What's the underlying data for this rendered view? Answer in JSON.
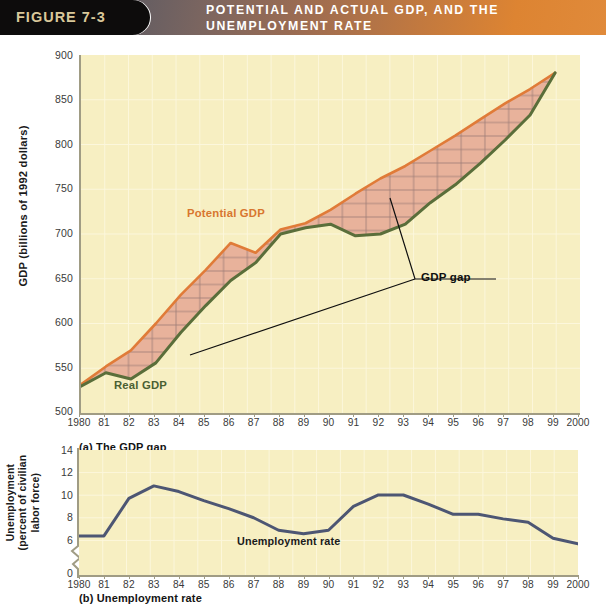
{
  "header": {
    "figure_number": "FIGURE 7-3",
    "title_line1": "POTENTIAL AND ACTUAL GDP, AND THE",
    "title_line2": "UNEMPLOYMENT RATE",
    "pill_color": "#0d0c0c",
    "figure_number_color": "#d9c89a",
    "gradient_start": "#4b5264",
    "gradient_end": "#e08a3a"
  },
  "panel_a": {
    "caption": "(a) The GDP gap",
    "ylabel": "GDP (billions of 1992 dollars)",
    "series_label_potential": "Potential GDP",
    "series_label_real": "Real GDP",
    "annotation_gap": "GDP gap"
  },
  "panel_b": {
    "caption": "(b) Unemployment rate",
    "ylabel_line1": "Unemployment",
    "ylabel_line2": "(percent of civilian",
    "ylabel_line3": "labor force)",
    "series_label": "Unemployment rate"
  },
  "footnote": "",
  "chart_data": [
    {
      "type": "area",
      "id": "panel-a",
      "title": "(a) The GDP gap",
      "xlabel": "",
      "ylabel": "GDP (billions of 1992 dollars)",
      "xlim": [
        1980,
        2000
      ],
      "ylim": [
        500,
        900
      ],
      "yticks": [
        500,
        550,
        600,
        650,
        700,
        750,
        800,
        850,
        900
      ],
      "xticks": [
        "1980",
        "81",
        "82",
        "83",
        "84",
        "85",
        "86",
        "87",
        "88",
        "89",
        "90",
        "91",
        "92",
        "93",
        "94",
        "95",
        "96",
        "97",
        "98",
        "99",
        "2000"
      ],
      "grid": true,
      "legend": "inline-labels",
      "annotations": [
        {
          "text": "Potential GDP",
          "color": "#d8762f",
          "x": 1985.1,
          "y": 707
        },
        {
          "text": "Real GDP",
          "color": "#4a6033",
          "x": 1981.6,
          "y": 527
        },
        {
          "text": "GDP gap",
          "color": "#0f0f0f",
          "x": 1994.4,
          "y": 657,
          "leader_to": [
            [
              1993.0,
              722
            ],
            [
              1983.8,
              612
            ]
          ]
        }
      ],
      "x": [
        1980,
        1981,
        1982,
        1983,
        1984,
        1985,
        1986,
        1987,
        1988,
        1989,
        1990,
        1991,
        1992,
        1993,
        1994,
        1995,
        1996,
        1997,
        1998,
        1999
      ],
      "series": [
        {
          "name": "Potential GDP",
          "color": "#e07b38",
          "values": [
            532,
            552,
            570,
            600,
            632,
            660,
            690,
            679,
            705,
            712,
            727,
            745,
            762,
            776,
            793,
            810,
            828,
            846,
            862,
            880
          ]
        },
        {
          "name": "Real GDP",
          "color": "#5a6e3a",
          "values": [
            530,
            545,
            538,
            556,
            590,
            620,
            648,
            668,
            700,
            707,
            711,
            698,
            700,
            711,
            735,
            755,
            779,
            805,
            833,
            880
          ]
        }
      ],
      "fill_between": {
        "label": "GDP gap",
        "fill_color": "#e8b29b",
        "hatch": "crosshatch",
        "hatch_color": "#9a7a72"
      }
    },
    {
      "type": "line",
      "id": "panel-b",
      "title": "(b) Unemployment rate",
      "xlabel": "",
      "ylabel": "Unemployment (percent of civilian labor force)",
      "xlim": [
        1980,
        2000
      ],
      "ylim": [
        6,
        14
      ],
      "yticks": [
        0,
        6,
        8,
        10,
        12,
        14
      ],
      "axis_break_between": [
        0,
        6
      ],
      "xticks": [
        "1980",
        "81",
        "82",
        "83",
        "84",
        "85",
        "86",
        "87",
        "88",
        "89",
        "90",
        "91",
        "92",
        "93",
        "94",
        "95",
        "96",
        "97",
        "98",
        "99",
        "2000"
      ],
      "grid": true,
      "annotations": [
        {
          "text": "Unemployment rate",
          "color": "#1a1a1a",
          "x": 1989.2,
          "y": 7.2
        }
      ],
      "x": [
        1980,
        1981,
        1982,
        1983,
        1984,
        1985,
        1986,
        1987,
        1988,
        1989,
        1990,
        1991,
        1992,
        1993,
        1994,
        1995,
        1996,
        1997,
        1998,
        1999,
        2000
      ],
      "series": [
        {
          "name": "Unemployment rate",
          "color": "#4d5673",
          "values": [
            7.5,
            7.5,
            10.8,
            11.9,
            11.4,
            10.6,
            9.9,
            9.1,
            8.0,
            7.7,
            8.0,
            10.1,
            11.1,
            11.1,
            10.3,
            9.4,
            9.4,
            9.0,
            8.7,
            7.3,
            6.8
          ]
        }
      ]
    }
  ]
}
